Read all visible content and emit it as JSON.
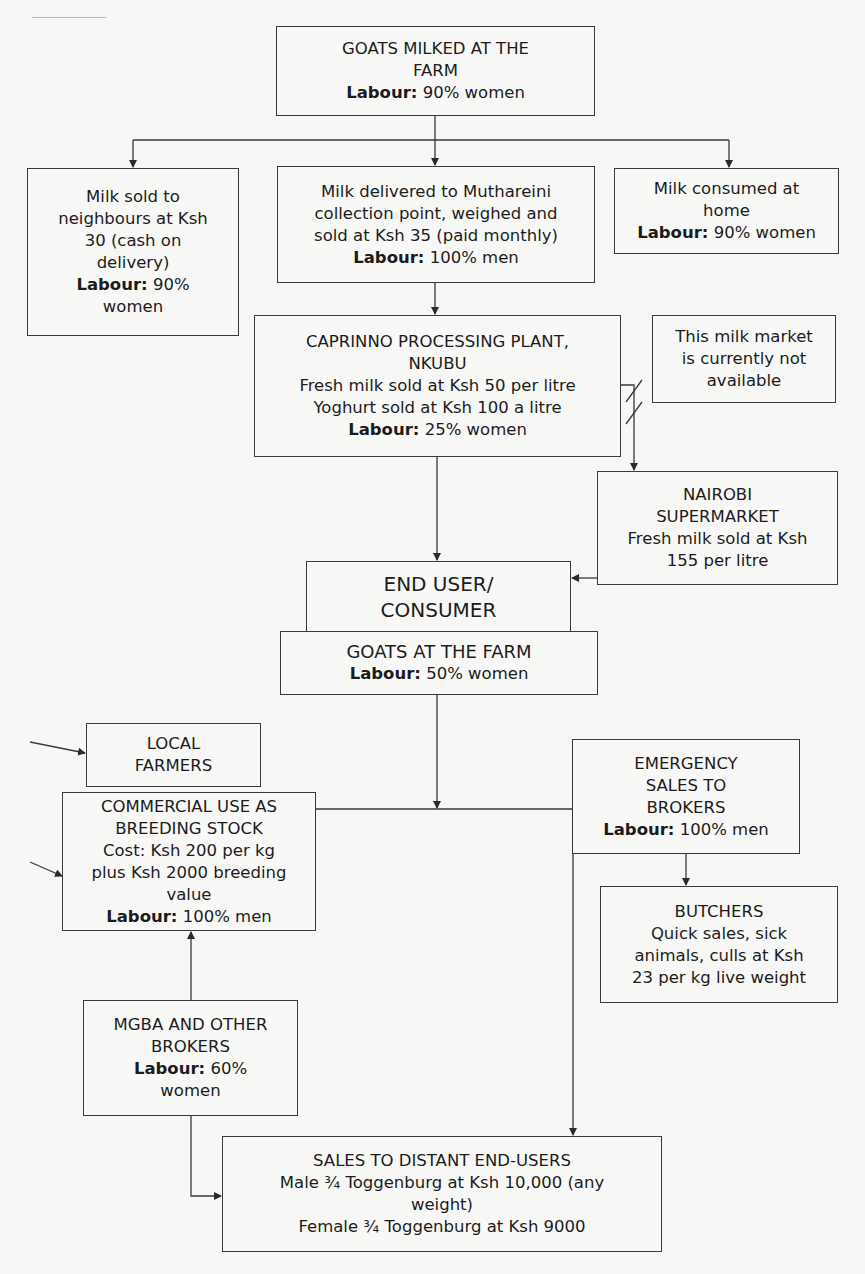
{
  "diagram": {
    "type": "flowchart",
    "label_prefix": "Labour:",
    "nodes": {
      "goats_milked": {
        "lines": [
          "GOATS MILKED AT THE",
          "FARM"
        ],
        "labour": "90% women"
      },
      "milk_neighbours": {
        "lines": [
          "Milk sold to",
          "neighbours at Ksh",
          "30 (cash on",
          "delivery)"
        ],
        "labour": "90%",
        "labour_cont": "women"
      },
      "milk_muthareini": {
        "lines": [
          "Milk delivered to Muthareini",
          "collection point, weighed and",
          "sold at Ksh 35 (paid monthly)"
        ],
        "labour": "100% men"
      },
      "milk_home": {
        "lines": [
          "Milk consumed at",
          "home"
        ],
        "labour": "90% women"
      },
      "caprinno": {
        "lines": [
          "CAPRINNO PROCESSING PLANT,",
          "NKUBU",
          "Fresh milk sold at Ksh 50 per litre",
          "Yoghurt sold at Ksh 100 a litre"
        ],
        "labour": "25% women"
      },
      "not_available": {
        "lines": [
          "This milk market",
          "is currently not",
          "available"
        ]
      },
      "nairobi": {
        "lines": [
          "NAIROBI",
          "SUPERMARKET",
          "Fresh milk sold at Ksh",
          "155 per litre"
        ]
      },
      "end_user": {
        "lines": [
          "END USER/",
          "CONSUMER"
        ]
      },
      "goats_farm": {
        "lines": [
          "GOATS AT THE FARM"
        ],
        "labour": "50% women"
      },
      "local_farmers": {
        "lines": [
          "LOCAL",
          "FARMERS"
        ]
      },
      "commercial": {
        "lines": [
          "COMMERCIAL USE AS",
          "BREEDING STOCK",
          "Cost: Ksh 200 per kg",
          "plus Ksh 2000 breeding",
          "value"
        ],
        "labour": "100% men"
      },
      "emergency": {
        "lines": [
          "EMERGENCY",
          "SALES TO",
          "BROKERS"
        ],
        "labour": "100% men"
      },
      "butchers": {
        "lines": [
          "BUTCHERS",
          "Quick sales, sick",
          "animals, culls at Ksh",
          "23 per kg live weight"
        ]
      },
      "mgba": {
        "lines": [
          "MGBA AND OTHER",
          "BROKERS"
        ],
        "labour": "60%",
        "labour_cont": "women"
      },
      "distant_sales": {
        "lines": [
          "SALES TO DISTANT END-USERS",
          "Male ¾ Toggenburg at Ksh 10,000 (any",
          "weight)",
          "Female ¾ Toggenburg at Ksh 9000"
        ]
      }
    },
    "edges": [
      {
        "from": "goats_milked",
        "to": "milk_neighbours"
      },
      {
        "from": "goats_milked",
        "to": "milk_muthareini"
      },
      {
        "from": "goats_milked",
        "to": "milk_home"
      },
      {
        "from": "milk_muthareini",
        "to": "caprinno"
      },
      {
        "from": "caprinno",
        "to": "nairobi",
        "note": "broken link (market not available)"
      },
      {
        "from": "caprinno",
        "to": "end_user"
      },
      {
        "from": "nairobi",
        "to": "end_user"
      },
      {
        "from": "goats_farm",
        "to": "commercial"
      },
      {
        "from": "goats_farm",
        "to": "emergency"
      },
      {
        "from": "goats_farm",
        "to": "distant_sales"
      },
      {
        "from": "emergency",
        "to": "butchers"
      },
      {
        "from": "mgba",
        "to": "commercial"
      },
      {
        "from": "mgba",
        "to": "distant_sales"
      }
    ],
    "colors": {
      "line": "#3a3a3a",
      "background": "#f7f7f6",
      "text": "#1c1c1c"
    }
  }
}
